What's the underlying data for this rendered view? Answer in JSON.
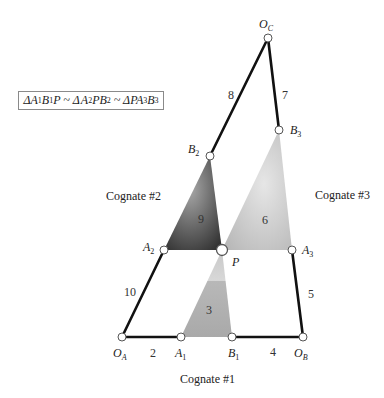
{
  "relation": {
    "text": "ΔA1B1P ~ ΔA2PB2 ~ ΔPA3B3",
    "parts": [
      {
        "t": "Δ"
      },
      {
        "t": "A"
      },
      {
        "s": "1"
      },
      {
        "t": "B"
      },
      {
        "s": "1"
      },
      {
        "t": "P ~ Δ"
      },
      {
        "t": "A"
      },
      {
        "s": "2"
      },
      {
        "t": "PB"
      },
      {
        "s": "2"
      },
      {
        "t": " ~ ΔPA"
      },
      {
        "s": "3"
      },
      {
        "t": "B"
      },
      {
        "s": "3"
      }
    ]
  },
  "points": {
    "OA": {
      "label": "O",
      "sub": "A",
      "x": 122,
      "y": 337
    },
    "A1": {
      "label": "A",
      "sub": "1",
      "x": 181,
      "y": 337
    },
    "B1": {
      "label": "B",
      "sub": "1",
      "x": 232,
      "y": 337
    },
    "OB": {
      "label": "O",
      "sub": "B",
      "x": 303,
      "y": 337
    },
    "A2": {
      "label": "A",
      "sub": "2",
      "x": 164,
      "y": 250
    },
    "P": {
      "label": "P",
      "sub": "",
      "x": 222,
      "y": 250
    },
    "A3": {
      "label": "A",
      "sub": "3",
      "x": 292,
      "y": 250
    },
    "B2": {
      "label": "B",
      "sub": "2",
      "x": 210,
      "y": 156
    },
    "B3": {
      "label": "B",
      "sub": "3",
      "x": 279,
      "y": 130
    },
    "OC": {
      "label": "O",
      "sub": "C",
      "x": 268,
      "y": 38
    }
  },
  "link_numbers": {
    "l2": "2",
    "l3": "3",
    "l4": "4",
    "l5": "5",
    "l6": "6",
    "l7": "7",
    "l8": "8",
    "l9": "9",
    "l10": "10"
  },
  "cognates": {
    "c1": "Cognate #1",
    "c2": "Cognate #2",
    "c3": "Cognate #3"
  },
  "colors": {
    "link": "#111111",
    "triangle3": "#b5b5b5",
    "triangle6": "#c2c2c2",
    "triangle9_dark": "#3a3a3a",
    "triangle9_light": "#9a9a9a",
    "pin_fill": "#ffffff",
    "pin_stroke": "#555555"
  }
}
